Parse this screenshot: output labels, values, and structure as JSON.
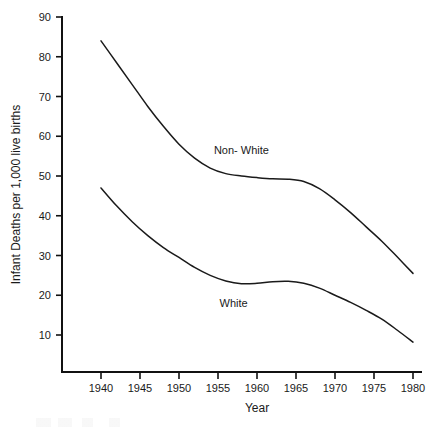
{
  "chart_data": {
    "type": "line",
    "title": "",
    "xlabel": "Year",
    "ylabel": "Infant Deaths per 1,000 live births",
    "xlim": [
      1938,
      1981
    ],
    "ylim": [
      0,
      92
    ],
    "xticks": [
      1940,
      1945,
      1950,
      1955,
      1960,
      1965,
      1970,
      1975,
      1980
    ],
    "xtick_labels": [
      "1940",
      "1945",
      "1950",
      "1955",
      "1960",
      "1965",
      "1970",
      "1975",
      "1980"
    ],
    "yticks": [
      10,
      20,
      30,
      40,
      50,
      60,
      70,
      80,
      90
    ],
    "ytick_labels": [
      "10",
      "20",
      "30",
      "40",
      "50",
      "60",
      "70",
      "80",
      "90"
    ],
    "grid": false,
    "legend_position": "inline-annotation",
    "series": [
      {
        "name": "Non- White",
        "label_x": 1958,
        "label_y": 55.5,
        "x": [
          1940,
          1942,
          1944,
          1946,
          1948,
          1950,
          1952,
          1954,
          1956,
          1958,
          1960,
          1962,
          1964,
          1966,
          1968,
          1970,
          1972,
          1974,
          1976,
          1978,
          1980
        ],
        "values": [
          84.0,
          78.5,
          73.0,
          67.5,
          62.5,
          58.0,
          54.5,
          52.0,
          50.6,
          50.0,
          49.6,
          49.3,
          49.2,
          48.6,
          46.8,
          44.0,
          40.8,
          37.2,
          33.6,
          29.6,
          25.5
        ]
      },
      {
        "name": "White",
        "label_x": 1957,
        "label_y": 17.0,
        "x": [
          1940,
          1942,
          1944,
          1946,
          1948,
          1950,
          1952,
          1954,
          1956,
          1958,
          1960,
          1962,
          1964,
          1966,
          1968,
          1970,
          1972,
          1974,
          1976,
          1978,
          1980
        ],
        "values": [
          47.0,
          42.5,
          38.5,
          35.0,
          32.0,
          29.5,
          27.0,
          25.0,
          23.6,
          22.9,
          23.0,
          23.4,
          23.5,
          23.0,
          21.8,
          20.0,
          18.2,
          16.2,
          14.0,
          11.2,
          8.2
        ]
      }
    ]
  }
}
